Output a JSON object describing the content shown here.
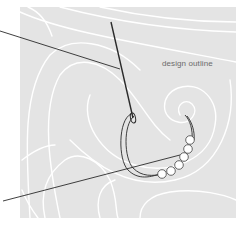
{
  "diagram": {
    "label_design_outline": "design outline",
    "colors": {
      "background": "#ffffff",
      "fabric": "#e4e4e4",
      "outline_lines": "#ffffff",
      "thread": "#2a2a2a",
      "bead_fill": "#ffffff",
      "bead_stroke": "#444444",
      "label_text": "#6b6b6b"
    },
    "bead_count": 6,
    "elements": [
      "fabric-swatch",
      "design-outline-curves",
      "needle",
      "thread",
      "leader-line-needle",
      "leader-line-thread",
      "beads"
    ]
  }
}
